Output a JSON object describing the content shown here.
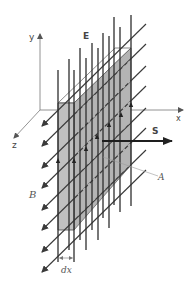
{
  "figure": {
    "type": "physics-diagram",
    "colors": {
      "background": "#ffffff",
      "slab_face": "#b4b4b4",
      "slab_front": "#c4c4c4",
      "slab_top": "#ffffff",
      "field_lines": "#3a3a3a",
      "axes": "#666666",
      "labels": "#555555"
    }
  },
  "axes": {
    "x_label": "x",
    "y_label": "y",
    "z_label": "z"
  },
  "labels": {
    "E": "E",
    "S": "S",
    "A": "A",
    "B": "B",
    "dx": "dx"
  },
  "diagram_data": {
    "electric_field": {
      "direction": "+y",
      "label": "E",
      "line_count": 12
    },
    "magnetic_field": {
      "direction": "+z (out toward viewer)",
      "label": "B",
      "line_count": 8
    },
    "poynting_vector": {
      "direction": "+x",
      "label": "S"
    },
    "slab": {
      "face_area_label": "A",
      "thickness_label": "dx"
    }
  }
}
